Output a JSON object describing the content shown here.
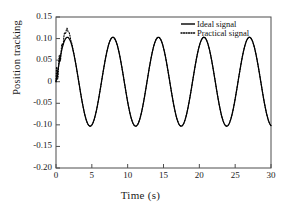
{
  "chart_data": {
    "type": "line",
    "title": "",
    "xlabel": "Time (s)",
    "ylabel": "Position tracking",
    "xlim": [
      0,
      30
    ],
    "ylim": [
      -0.2,
      0.15
    ],
    "xticks": [
      "0",
      "5",
      "10",
      "15",
      "20",
      "25",
      "30"
    ],
    "xtick_values": [
      0,
      5,
      10,
      15,
      20,
      25,
      30
    ],
    "yticks": [
      "0.15",
      "0.10",
      "0.05",
      "0",
      "-0.05",
      "-0.10",
      "-0.15",
      "-0.20"
    ],
    "ytick_values": [
      0.15,
      0.1,
      0.05,
      0,
      -0.05,
      -0.1,
      -0.15,
      -0.2
    ],
    "grid": false,
    "legend_position": "top-right",
    "series": [
      {
        "name": "Ideal signal",
        "style": "solid",
        "color": "#000000",
        "amplitude": 0.103,
        "period": 6.35,
        "phase": 0,
        "description": "sine wave amplitude 0.103, period 6.35 s, zero at t=0, first peak near t=1.55 s"
      },
      {
        "name": "Practical signal",
        "style": "dotted",
        "color": "#000000",
        "amplitude": 0.103,
        "period": 6.35,
        "phase": 0,
        "transient": {
          "range": [
            0,
            2.6
          ],
          "overshoot_peak": 0.121,
          "overshoot_time": 1.5,
          "description": "chattering/oscillatory transient overlaying the ideal signal during first ~2.5 s, then coincides with ideal signal"
        }
      }
    ]
  },
  "legend": {
    "entries": [
      {
        "label": "Ideal signal",
        "style": "solid"
      },
      {
        "label": "Practical signal",
        "style": "dotted"
      }
    ]
  },
  "axes": {
    "xlabel": "Time (s)",
    "ylabel": "Position tracking"
  }
}
